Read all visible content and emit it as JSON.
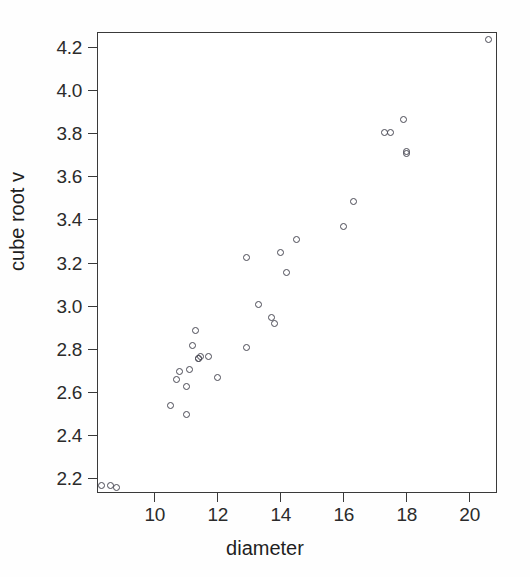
{
  "chart_data": {
    "type": "scatter",
    "title": "",
    "xlabel": "diameter",
    "ylabel": "cube root v",
    "xlim": [
      8.2,
      20.9
    ],
    "ylim": [
      2.13,
      4.27
    ],
    "xticks": [
      10,
      12,
      14,
      16,
      18,
      20
    ],
    "xtick_labels": [
      "10",
      "12",
      "14",
      "16",
      "18",
      "20"
    ],
    "yticks": [
      2.2,
      2.4,
      2.6,
      2.8,
      3.0,
      3.2,
      3.4,
      3.6,
      3.8,
      4.0,
      4.2
    ],
    "ytick_labels": [
      "2.2",
      "2.4",
      "2.6",
      "2.8",
      "3.0",
      "3.2",
      "3.4",
      "3.6",
      "3.8",
      "4.0",
      "4.2"
    ],
    "grid": false,
    "legend": false,
    "marker": "open-circle",
    "marker_color": "#4a4a55",
    "x": [
      8.3,
      8.6,
      8.8,
      10.5,
      10.7,
      10.8,
      11.0,
      11.0,
      11.1,
      11.2,
      11.3,
      11.4,
      11.4,
      11.4,
      11.7,
      12.0,
      12.9,
      12.9,
      13.3,
      13.7,
      13.8,
      14.0,
      14.2,
      14.5,
      16.0,
      16.3,
      17.3,
      17.5,
      17.9,
      18.0,
      18.0,
      20.6
    ],
    "y": [
      2.17,
      2.17,
      2.16,
      2.54,
      2.66,
      2.7,
      2.5,
      2.63,
      2.71,
      2.82,
      2.89,
      2.76,
      2.76,
      2.77,
      2.77,
      2.67,
      3.23,
      2.81,
      3.01,
      2.95,
      2.92,
      3.25,
      3.16,
      3.31,
      3.37,
      3.49,
      3.81,
      3.81,
      3.87,
      3.71,
      3.71,
      4.24
    ],
    "points": [
      {
        "x": 8.3,
        "y": 2.17
      },
      {
        "x": 8.6,
        "y": 2.17
      },
      {
        "x": 8.8,
        "y": 2.16
      },
      {
        "x": 10.5,
        "y": 2.54
      },
      {
        "x": 10.7,
        "y": 2.66
      },
      {
        "x": 10.8,
        "y": 2.7
      },
      {
        "x": 11.0,
        "y": 2.5
      },
      {
        "x": 11.0,
        "y": 2.63
      },
      {
        "x": 11.1,
        "y": 2.71
      },
      {
        "x": 11.2,
        "y": 2.82
      },
      {
        "x": 11.3,
        "y": 2.89
      },
      {
        "x": 11.4,
        "y": 2.76
      },
      {
        "x": 11.4,
        "y": 2.76
      },
      {
        "x": 11.45,
        "y": 2.77
      },
      {
        "x": 11.7,
        "y": 2.77
      },
      {
        "x": 12.0,
        "y": 2.67
      },
      {
        "x": 12.9,
        "y": 3.23
      },
      {
        "x": 12.9,
        "y": 2.81
      },
      {
        "x": 13.3,
        "y": 3.01
      },
      {
        "x": 13.7,
        "y": 2.95
      },
      {
        "x": 13.8,
        "y": 2.92
      },
      {
        "x": 14.0,
        "y": 3.25
      },
      {
        "x": 14.2,
        "y": 3.16
      },
      {
        "x": 14.5,
        "y": 3.31
      },
      {
        "x": 16.0,
        "y": 3.37
      },
      {
        "x": 16.3,
        "y": 3.49
      },
      {
        "x": 17.3,
        "y": 3.81
      },
      {
        "x": 17.5,
        "y": 3.81
      },
      {
        "x": 17.9,
        "y": 3.87
      },
      {
        "x": 18.0,
        "y": 3.71
      },
      {
        "x": 18.0,
        "y": 3.72
      },
      {
        "x": 20.6,
        "y": 4.24
      }
    ]
  }
}
